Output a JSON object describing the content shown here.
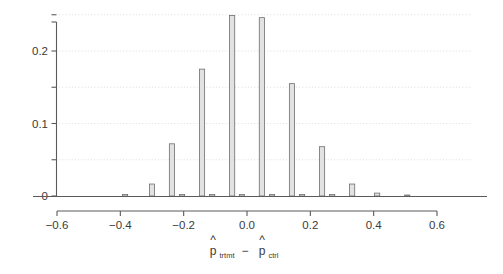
{
  "chart_data": {
    "type": "bar",
    "title": "",
    "subtitle": "",
    "xlabel": "p̂_trtmt − p̂_ctrl",
    "xlabel_parts": {
      "p_hat_1": "p",
      "hat": "^",
      "sub_1": "trtmt",
      "minus": "−",
      "p_hat_2": "p",
      "sub_2": "ctrl"
    },
    "ylabel": "",
    "xlim": [
      -0.72,
      0.66
    ],
    "ylim": [
      0,
      0.262
    ],
    "xticks": [
      -0.6,
      -0.4,
      -0.2,
      0.0,
      0.2,
      0.4,
      0.6
    ],
    "xticklabels": [
      "−0.6",
      "−0.4",
      "−0.2",
      "0.0",
      "0.2",
      "0.4",
      "0.6"
    ],
    "yticks": [
      0,
      0.05,
      0.1,
      0.15,
      0.2,
      0.25
    ],
    "yticklabels": [
      "0",
      "",
      "0.1",
      "",
      "0.2",
      ""
    ],
    "ytick_labeled": [
      0,
      0.1,
      0.2
    ],
    "grid": true,
    "grid_axis": "y",
    "grid_style": "dotted",
    "legend": null,
    "bin_width": 0.0316,
    "bar_color": "#e2e2e2",
    "bar_edge_color": "#6e6e6e",
    "axis_color": "#5a5a5a",
    "grid_color": "#cfcfcf",
    "x": [
      -0.385,
      -0.3,
      -0.237,
      -0.205,
      -0.142,
      -0.11,
      -0.047,
      -0.016,
      0.047,
      0.079,
      0.142,
      0.174,
      0.221,
      0.237,
      0.332,
      0.411,
      0.506
    ],
    "values": [
      0.0025,
      0.0165,
      0.072,
      0.0025,
      0.175,
      0.0025,
      0.249,
      0.0025,
      0.246,
      0.0025,
      0.155,
      0.0025,
      0.068,
      0.0025,
      0.0165,
      0.004,
      0.0015
    ],
    "bars": [
      {
        "center": -0.385,
        "value": 0.0022,
        "label": "−0.385"
      },
      {
        "center": -0.3,
        "value": 0.0165,
        "label": "−0.300"
      },
      {
        "center": -0.237,
        "value": 0.072,
        "label": "−0.237"
      },
      {
        "center": -0.205,
        "value": 0.002,
        "label": "−0.205"
      },
      {
        "center": -0.142,
        "value": 0.175,
        "label": "−0.142"
      },
      {
        "center": -0.11,
        "value": 0.002,
        "label": "−0.110"
      },
      {
        "center": -0.047,
        "value": 0.249,
        "label": "−0.047"
      },
      {
        "center": -0.016,
        "value": 0.002,
        "label": "−0.016"
      },
      {
        "center": 0.047,
        "value": 0.246,
        "label": "0.047"
      },
      {
        "center": 0.079,
        "value": 0.002,
        "label": "0.079"
      },
      {
        "center": 0.142,
        "value": 0.155,
        "label": "0.142"
      },
      {
        "center": 0.174,
        "value": 0.002,
        "label": "0.174"
      },
      {
        "center": 0.237,
        "value": 0.068,
        "label": "0.237"
      },
      {
        "center": 0.269,
        "value": 0.002,
        "label": "0.269"
      },
      {
        "center": 0.332,
        "value": 0.0165,
        "label": "0.332"
      },
      {
        "center": 0.411,
        "value": 0.004,
        "label": "0.411"
      },
      {
        "center": 0.506,
        "value": 0.0012,
        "label": "0.506"
      }
    ]
  }
}
